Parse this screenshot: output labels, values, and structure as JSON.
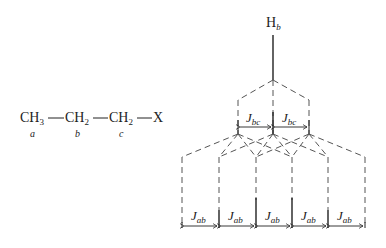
{
  "molecule": {
    "groups": [
      {
        "text": "CH",
        "sub": "3",
        "label": "a"
      },
      {
        "text": "CH",
        "sub": "2",
        "label": "b"
      },
      {
        "text": "CH",
        "sub": "2",
        "label": "c"
      },
      {
        "text": "X",
        "sub": "",
        "label": ""
      }
    ]
  },
  "diagram": {
    "proton_label": "H",
    "proton_sub": "b",
    "coupling_bc": {
      "main": "J",
      "sub": "bc"
    },
    "coupling_ab": {
      "main": "J",
      "sub": "ab"
    },
    "num_bc_splits": 2,
    "num_ab_splits": 5,
    "final_lines": 6
  },
  "colors": {
    "line": "#222222",
    "dash": "#555555"
  }
}
